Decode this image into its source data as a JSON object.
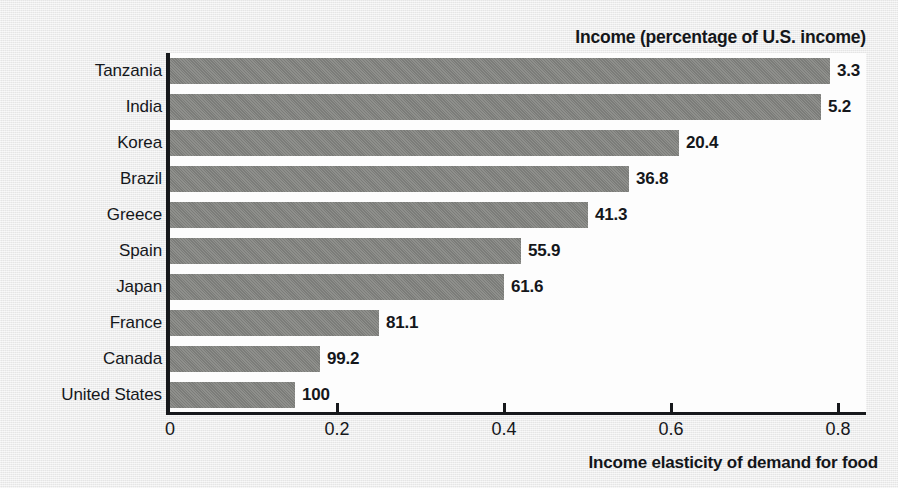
{
  "chart_data": {
    "type": "bar",
    "orientation": "horizontal",
    "title": "Income (percentage of U.S. income)",
    "xlabel": "Income elasticity of demand for food",
    "ylabel": "",
    "categories": [
      "Tanzania",
      "India",
      "Korea",
      "Brazil",
      "Greece",
      "Spain",
      "Japan",
      "France",
      "Canada",
      "United States"
    ],
    "values": [
      0.79,
      0.78,
      0.61,
      0.55,
      0.5,
      0.42,
      0.4,
      0.25,
      0.18,
      0.15
    ],
    "point_labels": [
      "3.3",
      "5.2",
      "20.4",
      "36.8",
      "41.3",
      "55.9",
      "61.6",
      "81.1",
      "99.2",
      "100"
    ],
    "series": [
      {
        "name": "Income elasticity of demand for food",
        "values": [
          0.79,
          0.78,
          0.61,
          0.55,
          0.5,
          0.42,
          0.4,
          0.25,
          0.18,
          0.15
        ]
      },
      {
        "name": "Income (percentage of U.S. income)",
        "values": [
          3.3,
          5.2,
          20.4,
          36.8,
          41.3,
          55.9,
          61.6,
          81.1,
          99.2,
          100
        ]
      }
    ],
    "xlim": [
      0,
      0.835
    ],
    "xticks": [
      0,
      0.2,
      0.4,
      0.6,
      0.8
    ],
    "xtick_labels": [
      "0",
      "0.2",
      "0.4",
      "0.6",
      "0.8"
    ],
    "grid": false,
    "legend": "none",
    "bar_color": "#82837f",
    "plot_background": "#fdfdfd",
    "page_background": "#e9e9e9",
    "axis_color": "#17191c"
  },
  "rows": [
    {
      "country": "Tanzania",
      "elasticity": 0.79,
      "income_label": "3.3"
    },
    {
      "country": "India",
      "elasticity": 0.78,
      "income_label": "5.2"
    },
    {
      "country": "Korea",
      "elasticity": 0.61,
      "income_label": "20.4"
    },
    {
      "country": "Brazil",
      "elasticity": 0.55,
      "income_label": "36.8"
    },
    {
      "country": "Greece",
      "elasticity": 0.5,
      "income_label": "41.3"
    },
    {
      "country": "Spain",
      "elasticity": 0.42,
      "income_label": "55.9"
    },
    {
      "country": "Japan",
      "elasticity": 0.4,
      "income_label": "61.6"
    },
    {
      "country": "France",
      "elasticity": 0.25,
      "income_label": "81.1"
    },
    {
      "country": "Canada",
      "elasticity": 0.18,
      "income_label": "99.2"
    },
    {
      "country": "United States",
      "elasticity": 0.15,
      "income_label": "100"
    }
  ],
  "axis": {
    "ticks": [
      {
        "value": 0,
        "label": "0"
      },
      {
        "value": 0.2,
        "label": "0.2"
      },
      {
        "value": 0.4,
        "label": "0.4"
      },
      {
        "value": 0.6,
        "label": "0.6"
      },
      {
        "value": 0.8,
        "label": "0.8"
      }
    ]
  }
}
